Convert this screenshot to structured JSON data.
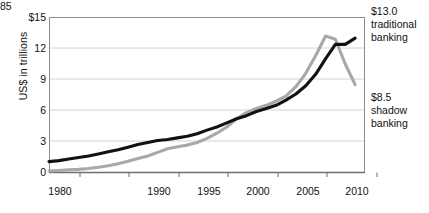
{
  "chart_data": {
    "type": "line",
    "title": "",
    "subtitle": "",
    "xlabel": "",
    "ylabel": "US$ in trillions",
    "xlim": [
      1979,
      2011
    ],
    "ylim": [
      0,
      15
    ],
    "grid": true,
    "legend_position": "right-annotations",
    "x_ticks": [
      "1980",
      "1985",
      "1990",
      "1995",
      "2000",
      "2005",
      "2010"
    ],
    "x_tick_values": [
      1980,
      1985,
      1990,
      1995,
      2000,
      2005,
      2010
    ],
    "y_ticks": [
      "0",
      "3",
      "6",
      "9",
      "12",
      "$15"
    ],
    "y_tick_values": [
      0,
      3,
      6,
      9,
      12,
      15
    ],
    "x": [
      1979,
      1980,
      1981,
      1982,
      1983,
      1984,
      1985,
      1986,
      1987,
      1988,
      1989,
      1990,
      1991,
      1992,
      1993,
      1994,
      1995,
      1996,
      1997,
      1998,
      1999,
      2000,
      2001,
      2002,
      2003,
      2004,
      2005,
      2006,
      2007,
      2008,
      2009,
      2010
    ],
    "series": [
      {
        "name": "traditional banking",
        "color": "#111111",
        "end_label": "$13.0",
        "end_value": 13.0,
        "values": [
          1.05,
          1.15,
          1.3,
          1.45,
          1.6,
          1.8,
          2.0,
          2.2,
          2.45,
          2.7,
          2.9,
          3.1,
          3.2,
          3.35,
          3.5,
          3.75,
          4.1,
          4.4,
          4.8,
          5.2,
          5.5,
          5.9,
          6.2,
          6.5,
          7.0,
          7.6,
          8.4,
          9.5,
          11.0,
          12.4,
          12.4,
          13.0
        ]
      },
      {
        "name": "shadow banking",
        "color": "#a8a8a8",
        "end_label": "$8.5",
        "end_value": 8.5,
        "peak_year": 2007,
        "peak_value": 13.2,
        "values": [
          0.15,
          0.2,
          0.25,
          0.3,
          0.38,
          0.5,
          0.65,
          0.85,
          1.1,
          1.35,
          1.6,
          1.95,
          2.3,
          2.5,
          2.65,
          2.9,
          3.3,
          3.8,
          4.4,
          5.2,
          5.8,
          6.2,
          6.5,
          6.9,
          7.4,
          8.3,
          9.6,
          11.3,
          13.2,
          12.9,
          10.5,
          8.5
        ]
      }
    ],
    "annotations": [
      {
        "id": "traditional",
        "amount": "$13.0",
        "line1": "traditional",
        "line2": "banking"
      },
      {
        "id": "shadow",
        "amount": "$8.5",
        "line1": "shadow",
        "line2": "banking"
      }
    ]
  }
}
